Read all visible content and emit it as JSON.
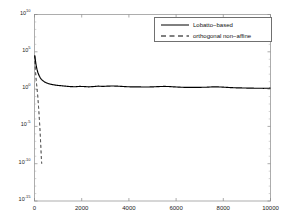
{
  "chart_data": {
    "type": "line",
    "title": "",
    "xlabel": "",
    "ylabel": "",
    "scale": {
      "x": "linear",
      "y": "log"
    },
    "xlim": [
      0,
      10000
    ],
    "ylim": [
      1e-15,
      10000000000.0
    ],
    "grid": false,
    "legend_position": "top-right",
    "xticks": [
      0,
      2000,
      4000,
      6000,
      8000,
      10000
    ],
    "xtick_labels": [
      "0",
      "2000",
      "4000",
      "6000",
      "8000",
      "10000"
    ],
    "yticks": [
      10000000000.0,
      100000.0,
      1,
      1e-05,
      1e-10,
      1e-15
    ],
    "ytick_labels": [
      "10",
      "10",
      "10",
      "10",
      "10",
      "10"
    ],
    "ytick_exponents": [
      "10",
      "5",
      "0",
      "-5",
      "-10",
      "-15"
    ],
    "series": [
      {
        "name": "Lobatto-based",
        "style": "solid",
        "color": "#000000",
        "x": [
          10,
          30,
          55,
          80,
          110,
          140,
          175,
          210,
          250,
          300,
          360,
          430,
          510,
          600,
          700,
          820,
          950,
          1100,
          1300,
          1500,
          1700,
          1900,
          2100,
          2300,
          2500,
          2700,
          2900,
          3100,
          3300,
          3500,
          3700,
          3900,
          4100,
          4300,
          4500,
          4700,
          4900,
          5100,
          5300,
          5500,
          5700,
          5900,
          6100,
          6300,
          6500,
          6700,
          6900,
          7100,
          7300,
          7500,
          7700,
          7900,
          8100,
          8300,
          8500,
          8700,
          8900,
          9100,
          9300,
          9500,
          9700,
          9900,
          10000
        ],
        "y": [
          32000.0,
          11000.0,
          3000.0,
          1000.0,
          400.0,
          180.0,
          90,
          52,
          30,
          19,
          13,
          9.0,
          6.8,
          5.3,
          4.4,
          3.7,
          3.2,
          2.9,
          2.5,
          2.2,
          2.05,
          2.3,
          2.2,
          2.0,
          2.2,
          2.5,
          2.3,
          2.5,
          2.6,
          2.5,
          2.3,
          2.1,
          2.0,
          2.0,
          1.95,
          1.9,
          1.95,
          2.05,
          2.2,
          2.3,
          2.2,
          2.0,
          1.85,
          1.75,
          1.7,
          1.7,
          1.72,
          1.75,
          1.8,
          1.95,
          2.0,
          1.9,
          1.75,
          1.6,
          1.5,
          1.45,
          1.4,
          1.35,
          1.32,
          1.3,
          1.28,
          1.3,
          1.35
        ]
      },
      {
        "name": "orthogonal non-affine",
        "style": "dashed",
        "color": "#000000",
        "x": [
          10,
          40,
          70,
          100,
          130,
          160,
          190,
          210,
          230,
          250,
          270,
          290,
          305
        ],
        "y": [
          32000.0,
          300.0,
          18,
          2.0,
          0.22,
          0.015,
          0.0006,
          6e-05,
          5e-06,
          3e-07,
          1.5e-08,
          6e-10,
          1e-10
        ]
      }
    ]
  },
  "legend": {
    "items": [
      {
        "label": "Lobatto−based",
        "style": "solid"
      },
      {
        "label": "orthogonal non−affine",
        "style": "dashed"
      }
    ]
  },
  "axes": {
    "ytick_mantissa": "10",
    "ytick_exponents": [
      "10",
      "5",
      "0",
      "-5",
      "-10",
      "-15"
    ],
    "xtick_labels": [
      "0",
      "2000",
      "4000",
      "6000",
      "8000",
      "10000"
    ]
  }
}
